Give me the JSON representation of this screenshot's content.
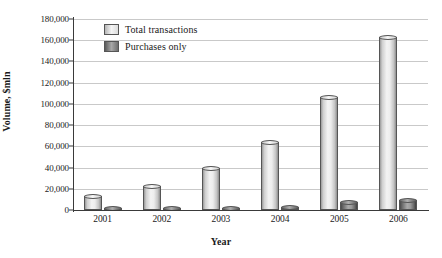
{
  "chart_data": {
    "type": "bar",
    "title": "",
    "xlabel": "Year",
    "ylabel": "Volume, $mln",
    "categories": [
      "2001",
      "2002",
      "2003",
      "2004",
      "2005",
      "2006"
    ],
    "series": [
      {
        "name": "Total transactions",
        "values": [
          13200,
          23000,
          40000,
          64000,
          106500,
          163000
        ],
        "color": "#eeeeee"
      },
      {
        "name": "Purchases only",
        "values": [
          800,
          1200,
          1600,
          3000,
          7500,
          9000
        ],
        "color": "#808080"
      }
    ],
    "ylim": [
      0,
      180000
    ],
    "ytick_values": [
      0,
      20000,
      40000,
      60000,
      80000,
      100000,
      120000,
      140000,
      160000,
      180000
    ],
    "ytick_labels": [
      "0",
      "20,000",
      "40,000",
      "60,000",
      "80,000",
      "100,000",
      "120,000",
      "140,000",
      "160,000",
      "180,000"
    ],
    "grid": true,
    "legend_position": "top-left"
  },
  "axes": {
    "y_title": "Volume, $mln",
    "x_title": "Year"
  },
  "legend": {
    "items": [
      {
        "label": "Total transactions",
        "swatch": "light-gray-gradient"
      },
      {
        "label": "Purchases only",
        "swatch": "dark-gray-gradient"
      }
    ]
  }
}
